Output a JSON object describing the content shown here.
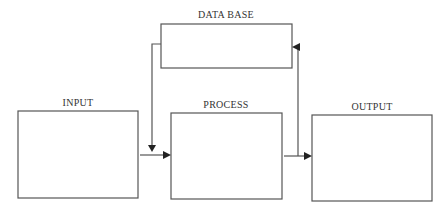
{
  "diagram": {
    "type": "flowchart",
    "nodes": [
      {
        "id": "database",
        "label": "DATA BASE"
      },
      {
        "id": "input",
        "label": "INPUT"
      },
      {
        "id": "process",
        "label": "PROCESS"
      },
      {
        "id": "output",
        "label": "OUTPUT"
      }
    ],
    "edges": [
      {
        "from": "input",
        "to": "process"
      },
      {
        "from": "database",
        "to": "process"
      },
      {
        "from": "process",
        "to": "output"
      },
      {
        "from": "process",
        "to": "database"
      }
    ],
    "colors": {
      "stroke": "#555555",
      "arrowhead": "#222222",
      "background": "#ffffff"
    }
  }
}
